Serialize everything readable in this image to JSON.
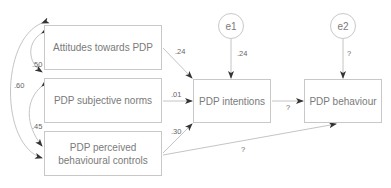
{
  "diagram": {
    "type": "structural-equation-model",
    "nodes": {
      "attitudes": "Attitudes towards PDP",
      "norms": "PDP subjective norms",
      "controls_line1": "PDP perceived",
      "controls_line2": "behavioural controls",
      "intentions": "PDP intentions",
      "behaviour": "PDP behaviour",
      "e1": "e1",
      "e2": "e2"
    },
    "paths": {
      "attitudes_to_intentions": ".24",
      "norms_to_intentions": ".01",
      "controls_to_intentions": ".30",
      "intentions_to_behaviour": "?",
      "controls_to_behaviour": "?",
      "e1_to_intentions": ".24",
      "e2_to_behaviour": "?"
    },
    "correlations": {
      "attitudes_norms": ".50",
      "attitudes_controls": ".60",
      "norms_controls": ".45"
    },
    "colors": {
      "line": "#b5b5b5",
      "arrowhead": "#333333",
      "text": "#7a7a7a"
    }
  }
}
